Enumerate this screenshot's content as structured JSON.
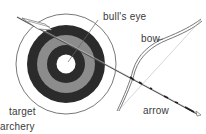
{
  "figure": {
    "caption": "archery",
    "labels": {
      "bullseye": "bull's eye",
      "bow": "bow",
      "target": "target",
      "arrow": "arrow"
    },
    "colors": {
      "dark_ring": "#2b2b2b",
      "gray_ring": "#8c8c8c",
      "center": "#ffffff",
      "line": "#444444"
    }
  }
}
